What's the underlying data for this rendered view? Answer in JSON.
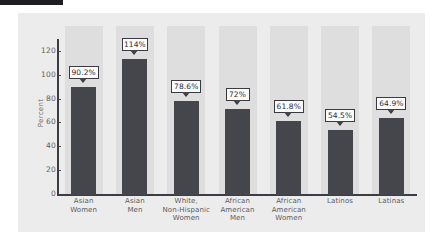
{
  "chart_data": {
    "type": "bar",
    "title": "",
    "xlabel": "",
    "ylabel": "Percent",
    "ylim": [
      0,
      130
    ],
    "yticks": [
      0,
      20,
      40,
      60,
      80,
      100,
      120
    ],
    "ytick_labels": [
      "0",
      "20",
      "40",
      "60",
      "80",
      "100",
      "120"
    ],
    "grid": false,
    "legend": null,
    "categories": [
      "Asian\nWomen",
      "Asian\nMen",
      "White,\nNon-Hispanic\nWomen",
      "African\nAmerican\nMen",
      "African\nAmerican\nWomen",
      "Latinos",
      "Latinas"
    ],
    "category_lines": [
      [
        "Asian",
        "Women"
      ],
      [
        "Asian",
        "Men"
      ],
      [
        "White,",
        "Non-Hispanic",
        "Women"
      ],
      [
        "African",
        "American",
        "Men"
      ],
      [
        "African",
        "American",
        "Women"
      ],
      [
        "Latinos"
      ],
      [
        "Latinas"
      ]
    ],
    "values": [
      90.2,
      114,
      78.6,
      72,
      61.8,
      54.5,
      64.9
    ],
    "data_labels": [
      "90.2%",
      "114%",
      "78.6%",
      "72%",
      "61.8%",
      "54.5%",
      "64.9%"
    ],
    "colors": {
      "bar": "#45454c",
      "panel_background": "#ececed",
      "band": "#dededf",
      "axis": "#3c3c42",
      "callout_background": "#fbfbfb",
      "callout_border": "#3a3a40",
      "tick_text": "#5e5e63",
      "label_text": "#5b5b60",
      "corner_tab": "#1d1d22"
    }
  }
}
